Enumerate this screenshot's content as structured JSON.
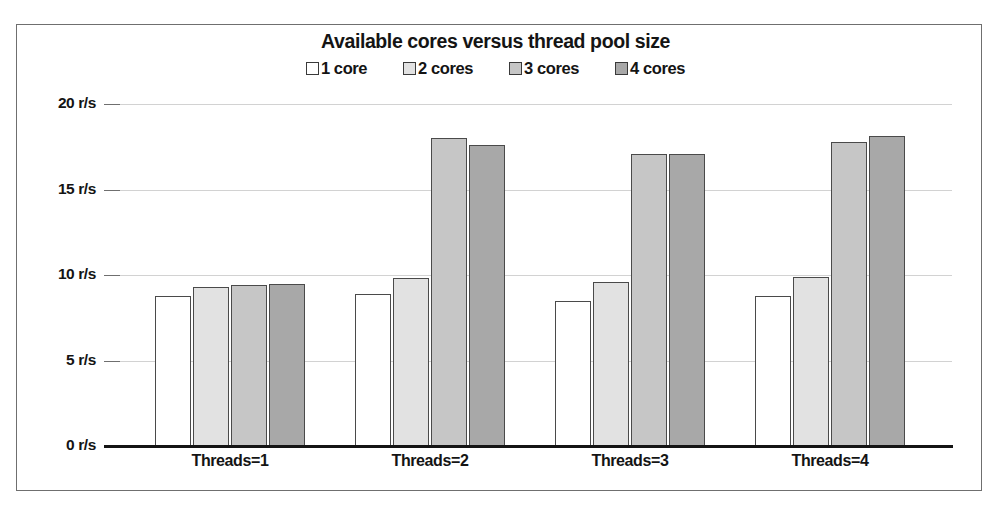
{
  "chart_data": {
    "type": "bar",
    "title": "Available cores versus thread pool size",
    "xlabel": "",
    "ylabel": "",
    "categories": [
      "Threads=1",
      "Threads=2",
      "Threads=3",
      "Threads=4"
    ],
    "series": [
      {
        "name": "1 core",
        "color": "#ffffff",
        "values": [
          8.8,
          8.9,
          8.5,
          8.8
        ]
      },
      {
        "name": "2 cores",
        "color": "#e2e2e2",
        "values": [
          9.3,
          9.8,
          9.6,
          9.9
        ]
      },
      {
        "name": "3 cores",
        "color": "#c6c6c6",
        "values": [
          9.4,
          18.0,
          17.1,
          17.8
        ]
      },
      {
        "name": "4 cores",
        "color": "#a8a8a8",
        "values": [
          9.5,
          17.6,
          17.1,
          18.1
        ]
      }
    ],
    "ylim": [
      0,
      20
    ],
    "yticks": [
      0,
      5,
      10,
      15,
      20
    ],
    "ytick_labels": [
      "0 r/s",
      "5 r/s",
      "10 r/s",
      "15 r/s",
      "20 r/s"
    ],
    "grid": true,
    "legend_position": "top-center",
    "units": "r/s"
  },
  "legend": {
    "items": [
      {
        "label": "1 core",
        "swatch": "#ffffff"
      },
      {
        "label": "2 cores",
        "swatch": "#e2e2e2"
      },
      {
        "label": "3 cores",
        "swatch": "#c6c6c6"
      },
      {
        "label": "4 cores",
        "swatch": "#a8a8a8"
      }
    ]
  },
  "axis": {
    "y_labels": [
      "20 r/s",
      "15 r/s",
      "10 r/s",
      "5 r/s",
      "0 r/s"
    ],
    "x_labels": [
      "Threads=1",
      "Threads=2",
      "Threads=3",
      "Threads=4"
    ]
  },
  "colors": {
    "frame": "#6f6f6f",
    "gridline": "#d2d2d2",
    "baseline": "#141414",
    "bar_border": "#4a4a4a",
    "text": "#141414"
  }
}
